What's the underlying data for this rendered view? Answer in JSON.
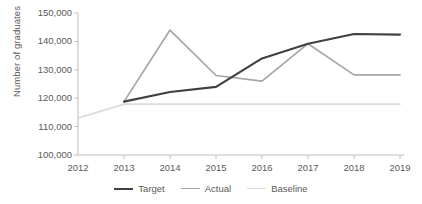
{
  "chart_data": {
    "type": "line",
    "title": "",
    "xlabel": "",
    "ylabel": "Number of graduates",
    "x": [
      2012,
      2013,
      2014,
      2015,
      2016,
      2017,
      2018,
      2019
    ],
    "xtick_labels": [
      "2012",
      "2013",
      "2014",
      "2015",
      "2016",
      "2017",
      "2018",
      "2019"
    ],
    "ytick_labels": [
      "100,000",
      "110,000",
      "120,000",
      "130,000",
      "140,000",
      "150,000"
    ],
    "yticks": [
      100000,
      110000,
      120000,
      130000,
      140000,
      150000
    ],
    "ylim": [
      100000,
      150000
    ],
    "xlim": [
      2012,
      2019
    ],
    "grid": false,
    "legend_position": "bottom",
    "series": [
      {
        "name": "Target",
        "color": "#404040",
        "width": 2.1,
        "x": [
          2013,
          2014,
          2015,
          2016,
          2017,
          2018,
          2019
        ],
        "values": [
          118800,
          122200,
          124000,
          134000,
          139200,
          142600,
          142400
        ]
      },
      {
        "name": "Actual",
        "color": "#a6a6a6",
        "width": 1.7,
        "x": [
          2013,
          2014,
          2015,
          2016,
          2017,
          2018,
          2019
        ],
        "values": [
          118800,
          144000,
          128000,
          126000,
          139200,
          128200,
          128200
        ]
      },
      {
        "name": "Baseline",
        "color": "#dcdcdc",
        "width": 1.7,
        "x": [
          2012,
          2013,
          2014,
          2015,
          2016,
          2017,
          2018,
          2019
        ],
        "values": [
          113000,
          117900,
          117900,
          117900,
          117900,
          117900,
          117900,
          117900
        ]
      }
    ]
  },
  "legend": {
    "items": [
      {
        "label": "Target",
        "color": "#404040",
        "width": 2.1
      },
      {
        "label": "Actual",
        "color": "#a6a6a6",
        "width": 1.7
      },
      {
        "label": "Baseline",
        "color": "#dcdcdc",
        "width": 1.7
      }
    ]
  },
  "axes": {
    "axis_color": "#bfbfbf",
    "tick_color": "#bfbfbf"
  }
}
